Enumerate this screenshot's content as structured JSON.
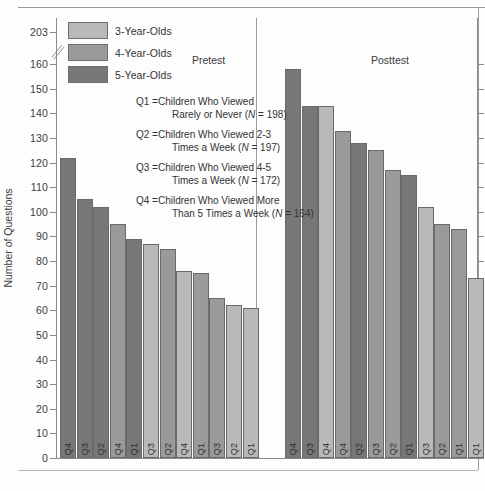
{
  "figure": {
    "y_axis_title": "Number of Questions",
    "panels": [
      {
        "id": "pretest",
        "title": "Pretest"
      },
      {
        "id": "posttest",
        "title": "Posttest"
      }
    ]
  },
  "legend": {
    "items": [
      {
        "label": "3-Year-Olds",
        "color": "#b9b9b9",
        "key": "age3"
      },
      {
        "label": "4-Year-Olds",
        "color": "#9a9a9a",
        "key": "age4"
      },
      {
        "label": "5-Year-Olds",
        "color": "#777777",
        "key": "age5"
      }
    ]
  },
  "q_definitions": [
    {
      "key": "Q1 =",
      "line1": "Children Who Viewed",
      "line2": "Rarely or Never (",
      "n_italic": "N",
      "n_value": " = 198)"
    },
    {
      "key": "Q2 =",
      "line1": "Children Who Viewed 2-3",
      "line2": "Times a Week (",
      "n_italic": "N",
      "n_value": " = 197)"
    },
    {
      "key": "Q3 =",
      "line1": "Children Who Viewed 4-5",
      "line2": "Times a Week (",
      "n_italic": "N",
      "n_value": " = 172)"
    },
    {
      "key": "Q4 =",
      "line1": "Children Who Viewed More",
      "line2": "Than 5 Times a Week (",
      "n_italic": "N",
      "n_value": " = 164)"
    }
  ],
  "chart_data": {
    "type": "bar",
    "title": "",
    "xlabel": "",
    "ylabel": "Number of Questions",
    "ylim": [
      0,
      203
    ],
    "axis_break": {
      "below": 160,
      "above": 203,
      "note": "scale break between 160 and 203"
    },
    "yticks": [
      0,
      10,
      20,
      30,
      40,
      50,
      60,
      70,
      80,
      90,
      100,
      110,
      120,
      130,
      140,
      150,
      160,
      203
    ],
    "ytick_labels": [
      "0",
      "10",
      "20",
      "30",
      "40",
      "50",
      "60",
      "70",
      "80",
      "90",
      "100",
      "110",
      "120",
      "130",
      "140",
      "150",
      "160",
      "203"
    ],
    "grid": false,
    "legend_position": "top-left",
    "series": [
      {
        "name": "3-Year-Olds",
        "color": "#b9b9b9"
      },
      {
        "name": "4-Year-Olds",
        "color": "#9a9a9a"
      },
      {
        "name": "5-Year-Olds",
        "color": "#777777"
      }
    ],
    "panels": [
      {
        "name": "Pretest",
        "bars": [
          {
            "label": "Q4",
            "value": 122,
            "group": "5-Year-Olds"
          },
          {
            "label": "Q3",
            "value": 105,
            "group": "5-Year-Olds"
          },
          {
            "label": "Q2",
            "value": 102,
            "group": "5-Year-Olds"
          },
          {
            "label": "Q4",
            "value": 95,
            "group": "4-Year-Olds"
          },
          {
            "label": "Q1",
            "value": 89,
            "group": "5-Year-Olds"
          },
          {
            "label": "Q3",
            "value": 87,
            "group": "3-Year-Olds"
          },
          {
            "label": "Q2",
            "value": 85,
            "group": "4-Year-Olds"
          },
          {
            "label": "Q4",
            "value": 76,
            "group": "3-Year-Olds"
          },
          {
            "label": "Q1",
            "value": 75,
            "group": "4-Year-Olds"
          },
          {
            "label": "Q3",
            "value": 65,
            "group": "4-Year-Olds"
          },
          {
            "label": "Q2",
            "value": 62,
            "group": "3-Year-Olds"
          },
          {
            "label": "Q1",
            "value": 61,
            "group": "3-Year-Olds"
          }
        ]
      },
      {
        "name": "Posttest",
        "bars": [
          {
            "label": "Q4",
            "value": 158,
            "group": "5-Year-Olds"
          },
          {
            "label": "Q3",
            "value": 143,
            "group": "5-Year-Olds"
          },
          {
            "label": "Q4",
            "value": 143,
            "group": "3-Year-Olds"
          },
          {
            "label": "Q4",
            "value": 133,
            "group": "4-Year-Olds"
          },
          {
            "label": "Q2",
            "value": 128,
            "group": "5-Year-Olds"
          },
          {
            "label": "Q3",
            "value": 125,
            "group": "4-Year-Olds"
          },
          {
            "label": "Q2",
            "value": 117,
            "group": "4-Year-Olds"
          },
          {
            "label": "Q1",
            "value": 115,
            "group": "5-Year-Olds"
          },
          {
            "label": "Q3",
            "value": 102,
            "group": "3-Year-Olds"
          },
          {
            "label": "Q2",
            "value": 95,
            "group": "4-Year-Olds"
          },
          {
            "label": "Q1",
            "value": 93,
            "group": "4-Year-Olds"
          },
          {
            "label": "Q1",
            "value": 73,
            "group": "3-Year-Olds"
          }
        ]
      }
    ]
  }
}
